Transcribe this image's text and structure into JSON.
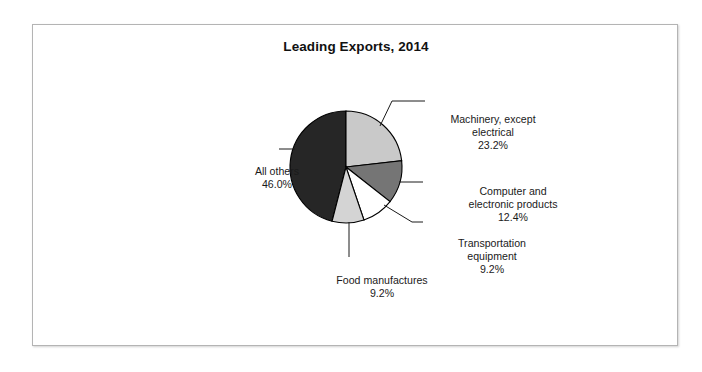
{
  "chart_data": {
    "type": "pie",
    "title": "Leading Exports, 2014",
    "categories": [
      "Machinery, except electrical",
      "Computer and electronic products",
      "Transportation equipment",
      "Food manufactures",
      "All others"
    ],
    "values": [
      23.2,
      12.4,
      9.2,
      9.2,
      46.0
    ],
    "value_labels": [
      "23.2%",
      "12.4%",
      "9.2%",
      "9.2%",
      "46.0%"
    ],
    "colors": [
      "#c9c9c9",
      "#757575",
      "#ffffff",
      "#d4d4d4",
      "#262626"
    ],
    "start_angle_deg": 0,
    "direction": "clockwise",
    "legend": "none",
    "labels_position": "outside-with-leader-lines",
    "grid": false,
    "xlabel": "",
    "ylabel": ""
  },
  "slices": {
    "machinery": {
      "name_line1": "Machinery, except",
      "name_line2": "electrical",
      "value": "23.2%"
    },
    "computer": {
      "name_line1": "Computer and",
      "name_line2": "electronic products",
      "value": "12.4%"
    },
    "transportation": {
      "name_line1": "Transportation",
      "name_line2": "equipment",
      "value": "9.2%"
    },
    "food": {
      "name_line1": "Food manufactures",
      "value": "9.2%"
    },
    "all_others": {
      "name_line1": "All others",
      "value": "46.0%"
    }
  }
}
